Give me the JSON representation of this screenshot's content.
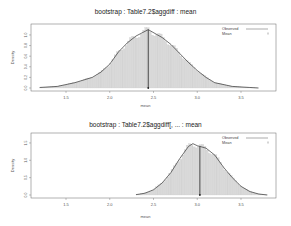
{
  "chart_data": [
    {
      "type": "histogram+density",
      "title": "bootstrap : Table7.2$aggdiff : mean",
      "xlabel": "mean",
      "ylabel": "Density",
      "xticks": [
        1.5,
        2.0,
        2.5,
        3.0,
        3.5
      ],
      "yticks": [
        0.0,
        0.2,
        0.4,
        0.6,
        0.8,
        1.0
      ],
      "xlim": [
        1.1,
        3.9
      ],
      "ylim": [
        0,
        1.15
      ],
      "observed_mean": 2.44,
      "legend": [
        "Observed",
        "Mean"
      ],
      "density_curve": {
        "x": [
          1.2,
          1.4,
          1.6,
          1.8,
          1.9,
          2.0,
          2.1,
          2.2,
          2.3,
          2.44,
          2.6,
          2.7,
          2.8,
          2.9,
          3.0,
          3.1,
          3.2,
          3.4,
          3.6,
          3.7
        ],
        "y": [
          0.01,
          0.03,
          0.1,
          0.2,
          0.3,
          0.45,
          0.68,
          0.85,
          0.98,
          1.1,
          0.95,
          0.82,
          0.65,
          0.48,
          0.33,
          0.2,
          0.1,
          0.03,
          0.01,
          0.0
        ]
      }
    },
    {
      "type": "histogram+density",
      "title": "bootstrap : Table7.2$aggdiff[, ... : mean",
      "xlabel": "mean",
      "ylabel": "Density",
      "xticks": [
        1.5,
        2.0,
        2.5,
        3.0,
        3.5
      ],
      "yticks": [
        0.0,
        0.5,
        1.0,
        1.5
      ],
      "xlim": [
        1.1,
        3.9
      ],
      "ylim": [
        0,
        1.7
      ],
      "observed_mean": 3.03,
      "legend": [
        "Observed",
        "Mean"
      ],
      "density_curve": {
        "x": [
          2.3,
          2.4,
          2.5,
          2.6,
          2.7,
          2.8,
          2.9,
          2.95,
          3.0,
          3.1,
          3.2,
          3.3,
          3.4,
          3.5,
          3.6,
          3.7,
          3.8
        ],
        "y": [
          0.01,
          0.05,
          0.15,
          0.35,
          0.65,
          1.05,
          1.4,
          1.48,
          1.42,
          1.35,
          1.15,
          0.8,
          0.5,
          0.25,
          0.1,
          0.03,
          0.0
        ]
      }
    }
  ]
}
